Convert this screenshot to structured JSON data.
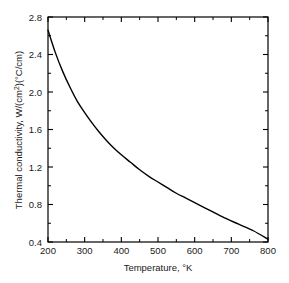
{
  "chart_data": {
    "type": "line",
    "title": "",
    "xlabel": "Temperature, °K",
    "ylabel_parts": {
      "lead": "Thermal conductivity, ",
      "unit_w": "W/(cm",
      "unit_sup": "2",
      "unit_tail": ")(°C/cm)"
    },
    "ylabel": "Thermal conductivity, W/(cm2)(°C/cm)",
    "xlim": [
      200,
      800
    ],
    "ylim": [
      0.4,
      2.8
    ],
    "xticks": [
      200,
      300,
      400,
      500,
      600,
      700,
      800
    ],
    "xtick_labels": [
      "200",
      "300",
      "400",
      "500",
      "600",
      "700",
      "800"
    ],
    "yticks": [
      0.4,
      0.8,
      1.2,
      1.6,
      2.0,
      2.4,
      2.8
    ],
    "ytick_labels": [
      "0.4",
      "0.8",
      "1.2",
      "1.6",
      "2.0",
      "2.4",
      "2.8"
    ],
    "y_minor_ticks": [
      0.6,
      1.0,
      1.4,
      1.8,
      2.2,
      2.6
    ],
    "x_minor_ticks": [
      250,
      350,
      450,
      550,
      650,
      750
    ],
    "grid": false,
    "legend": null,
    "line_color": "#000000",
    "line_width": 1.4,
    "axis_color": "#000000",
    "background": "#ffffff",
    "x": [
      200,
      220,
      240,
      260,
      280,
      300,
      320,
      340,
      360,
      380,
      400,
      425,
      450,
      475,
      500,
      525,
      550,
      575,
      600,
      640,
      680,
      720,
      760,
      800
    ],
    "values": [
      2.66,
      2.42,
      2.22,
      2.05,
      1.9,
      1.78,
      1.67,
      1.57,
      1.48,
      1.4,
      1.33,
      1.25,
      1.17,
      1.1,
      1.04,
      0.98,
      0.92,
      0.87,
      0.82,
      0.74,
      0.66,
      0.59,
      0.52,
      0.43
    ],
    "series": [
      {
        "name": "thermal conductivity",
        "values": [
          2.66,
          2.42,
          2.22,
          2.05,
          1.9,
          1.78,
          1.67,
          1.57,
          1.48,
          1.4,
          1.33,
          1.25,
          1.17,
          1.1,
          1.04,
          0.98,
          0.92,
          0.87,
          0.82,
          0.74,
          0.66,
          0.59,
          0.52,
          0.43
        ]
      }
    ]
  }
}
